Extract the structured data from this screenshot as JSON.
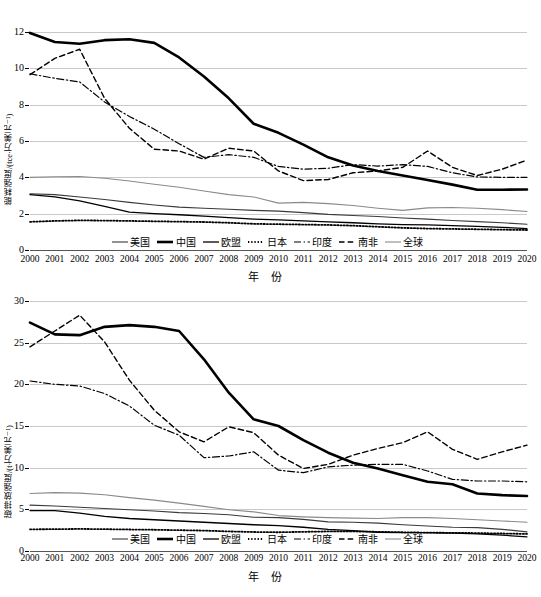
{
  "figure": {
    "xaxis_title": "年  份",
    "legend": [
      {
        "name": "美国",
        "key": "us",
        "style": "solid",
        "width": 1.1,
        "color": "#3a3a3a"
      },
      {
        "name": "中国",
        "key": "cn",
        "style": "solid",
        "width": 2.6,
        "color": "#000000"
      },
      {
        "name": "欧盟",
        "key": "eu",
        "style": "solid",
        "width": 1.3,
        "color": "#000000"
      },
      {
        "name": "日本",
        "key": "jp",
        "style": "dotted",
        "width": 1.8,
        "color": "#000000"
      },
      {
        "name": "印度",
        "key": "in",
        "style": "dashdot",
        "width": 1.2,
        "color": "#000000"
      },
      {
        "name": "南非",
        "key": "za",
        "style": "dashed",
        "width": 1.4,
        "color": "#000000"
      },
      {
        "name": "全球",
        "key": "world",
        "style": "solid",
        "width": 1.1,
        "color": "#8a8a8a"
      }
    ],
    "colors": {
      "grid": "#c9c9c9",
      "axis": "#000000",
      "text": "#000000",
      "world": "#8a8a8a",
      "us": "#3a3a3a"
    }
  },
  "chart_data": [
    {
      "id": "energy-intensity",
      "type": "line",
      "title": "",
      "xlabel": "年  份",
      "ylabel": "能耗强度/(tce·万美元⁻¹)",
      "x": [
        2000,
        2001,
        2002,
        2003,
        2004,
        2005,
        2006,
        2007,
        2008,
        2009,
        2010,
        2011,
        2012,
        2013,
        2014,
        2015,
        2016,
        2017,
        2018,
        2019,
        2020
      ],
      "xticklabels": [
        "2000",
        "2001",
        "2002",
        "2003",
        "2004",
        "2005",
        "2006",
        "2007",
        "2008",
        "2009",
        "2010",
        "2011",
        "2012",
        "2013",
        "2014",
        "2015",
        "2016",
        "2017",
        "2018",
        "2019",
        "2020"
      ],
      "yticks": [
        0,
        2,
        4,
        6,
        8,
        10,
        12
      ],
      "ylim": [
        0,
        12
      ],
      "grid": true,
      "legend_position": "bottom-inside",
      "series": [
        {
          "name": "美国",
          "key": "us",
          "values": [
            3.1,
            3.05,
            2.92,
            2.78,
            2.62,
            2.48,
            2.36,
            2.3,
            2.24,
            2.18,
            2.14,
            2.06,
            1.96,
            1.9,
            1.84,
            1.76,
            1.7,
            1.62,
            1.56,
            1.5,
            1.42
          ]
        },
        {
          "name": "中国",
          "key": "cn",
          "values": [
            11.95,
            11.45,
            11.35,
            11.55,
            11.6,
            11.4,
            10.6,
            9.55,
            8.35,
            6.95,
            6.45,
            5.8,
            5.1,
            4.65,
            4.35,
            4.1,
            3.85,
            3.6,
            3.32,
            3.32,
            3.33
          ]
        },
        {
          "name": "欧盟",
          "key": "eu",
          "values": [
            3.05,
            2.92,
            2.7,
            2.4,
            2.08,
            2.0,
            1.94,
            1.86,
            1.78,
            1.7,
            1.66,
            1.6,
            1.55,
            1.5,
            1.44,
            1.4,
            1.38,
            1.34,
            1.3,
            1.25,
            1.18
          ]
        },
        {
          "name": "日本",
          "key": "jp",
          "values": [
            1.55,
            1.6,
            1.63,
            1.62,
            1.6,
            1.58,
            1.56,
            1.54,
            1.5,
            1.44,
            1.42,
            1.4,
            1.38,
            1.34,
            1.28,
            1.22,
            1.18,
            1.16,
            1.14,
            1.12,
            1.1
          ]
        },
        {
          "name": "印度",
          "key": "in",
          "values": [
            9.7,
            9.45,
            9.25,
            8.15,
            7.35,
            6.65,
            5.85,
            5.1,
            5.25,
            5.1,
            4.6,
            4.45,
            4.5,
            4.7,
            4.62,
            4.7,
            4.6,
            4.25,
            4.02,
            4.0,
            4.0
          ]
        },
        {
          "name": "南非",
          "key": "za",
          "values": [
            9.65,
            10.55,
            11.05,
            8.35,
            6.7,
            5.55,
            5.45,
            5.0,
            5.6,
            5.45,
            4.35,
            3.82,
            3.88,
            4.25,
            4.35,
            4.55,
            5.45,
            4.55,
            4.1,
            4.45,
            4.95
          ]
        },
        {
          "name": "全球",
          "key": "world",
          "values": [
            4.0,
            4.03,
            4.05,
            3.95,
            3.8,
            3.62,
            3.45,
            3.25,
            3.05,
            2.92,
            2.58,
            2.62,
            2.55,
            2.45,
            2.3,
            2.18,
            2.32,
            2.34,
            2.3,
            2.22,
            2.12
          ]
        }
      ]
    },
    {
      "id": "carbon-intensity",
      "type": "line",
      "title": "",
      "xlabel": "年  份",
      "ylabel": "碳排放强度/(t·万美元⁻¹)",
      "x": [
        2000,
        2001,
        2002,
        2003,
        2004,
        2005,
        2006,
        2007,
        2008,
        2009,
        2010,
        2011,
        2012,
        2013,
        2014,
        2015,
        2016,
        2017,
        2018,
        2019,
        2020
      ],
      "xticklabels": [
        "2000",
        "2001",
        "2002",
        "2003",
        "2004",
        "2005",
        "2006",
        "2007",
        "2008",
        "2009",
        "2010",
        "2011",
        "2012",
        "2013",
        "2014",
        "2015",
        "2016",
        "2017",
        "2018",
        "2019",
        "2020"
      ],
      "yticks": [
        0,
        5,
        10,
        15,
        20,
        25,
        30
      ],
      "ylim": [
        0,
        30
      ],
      "grid": true,
      "legend_position": "bottom-inside",
      "series": [
        {
          "name": "美国",
          "key": "us",
          "values": [
            5.5,
            5.4,
            5.25,
            5.1,
            4.95,
            4.8,
            4.6,
            4.5,
            4.35,
            4.05,
            4.0,
            3.8,
            3.5,
            3.45,
            3.35,
            3.15,
            3.0,
            2.85,
            2.8,
            2.6,
            2.3
          ]
        },
        {
          "name": "中国",
          "key": "cn",
          "values": [
            27.4,
            26.0,
            25.9,
            26.9,
            27.1,
            26.9,
            26.4,
            23.0,
            19.0,
            15.8,
            15.0,
            13.3,
            11.8,
            10.6,
            9.9,
            9.1,
            8.3,
            8.0,
            6.9,
            6.7,
            6.6
          ]
        },
        {
          "name": "欧盟",
          "key": "eu",
          "values": [
            4.85,
            4.85,
            4.55,
            4.15,
            3.9,
            3.75,
            3.6,
            3.45,
            3.3,
            3.15,
            3.05,
            2.85,
            2.6,
            2.45,
            2.25,
            2.2,
            2.2,
            2.15,
            2.05,
            1.9,
            1.7
          ]
        },
        {
          "name": "日本",
          "key": "jp",
          "values": [
            2.6,
            2.62,
            2.65,
            2.62,
            2.58,
            2.55,
            2.5,
            2.45,
            2.35,
            2.28,
            2.25,
            2.3,
            2.35,
            2.35,
            2.3,
            2.25,
            2.2,
            2.18,
            2.15,
            2.1,
            2.05
          ]
        },
        {
          "name": "印度",
          "key": "in",
          "values": [
            20.4,
            20.0,
            19.8,
            18.9,
            17.4,
            15.1,
            13.9,
            11.2,
            11.4,
            11.9,
            9.7,
            9.4,
            10.1,
            10.3,
            10.4,
            10.4,
            9.6,
            8.6,
            8.4,
            8.4,
            8.3
          ]
        },
        {
          "name": "南非",
          "key": "za",
          "values": [
            24.5,
            26.4,
            28.3,
            25.1,
            20.5,
            16.9,
            14.3,
            13.1,
            14.9,
            14.2,
            11.5,
            9.9,
            10.4,
            11.5,
            12.3,
            13.0,
            14.3,
            12.2,
            11.0,
            11.9,
            12.7
          ]
        },
        {
          "name": "全球",
          "key": "world",
          "values": [
            6.9,
            7.0,
            6.95,
            6.75,
            6.4,
            6.1,
            5.75,
            5.35,
            4.95,
            4.7,
            4.25,
            4.1,
            4.0,
            3.95,
            3.9,
            4.0,
            4.0,
            3.9,
            3.75,
            3.6,
            3.45
          ]
        }
      ]
    }
  ]
}
